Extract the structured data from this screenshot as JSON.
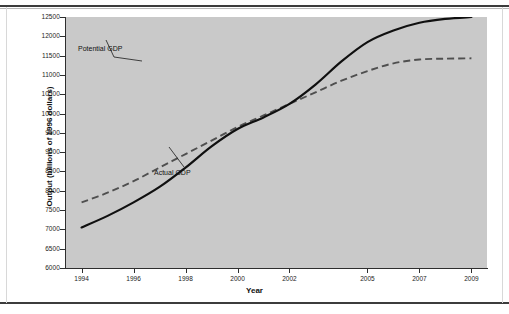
{
  "figure": {
    "background_color": "#ffffff",
    "plot_background_color": "#c9c9c9",
    "axis_color": "#2e2e2e"
  },
  "chart_data": {
    "type": "line",
    "title": "",
    "xlabel": "Year",
    "ylabel": "Output (billions of 1996 dollars)",
    "xlim": [
      1993.4,
      2009.6
    ],
    "ylim": [
      6000,
      12500
    ],
    "xticklabels": [
      "1994",
      "1996",
      "1998",
      "2000",
      "2002",
      "2005",
      "2007",
      "2009"
    ],
    "xtickvalues": [
      1994,
      1996,
      1998,
      2000,
      2002,
      2005,
      2007,
      2009
    ],
    "yticklabels": [
      "12500",
      "12000",
      "11500",
      "11000",
      "10500",
      "10000",
      "9500",
      "9000",
      "8500",
      "8000",
      "7500",
      "7000",
      "6500",
      "6000"
    ],
    "ytickvalues": [
      12500,
      12000,
      11500,
      11000,
      10500,
      10000,
      9500,
      9000,
      8500,
      8000,
      7500,
      7000,
      6500,
      6000
    ],
    "grid": false,
    "legend_position": "inline-annotations",
    "annotations": [
      {
        "text": "Potential GDP",
        "series": "Potential GDP"
      },
      {
        "text": "Actual GDP",
        "series": "Actual GDP"
      }
    ],
    "x": [
      1994,
      1995,
      1996,
      1997,
      1998,
      1999,
      2000,
      2001,
      2002,
      2003,
      2004,
      2005,
      2006,
      2007,
      2008,
      2009
    ],
    "series": [
      {
        "name": "Actual GDP",
        "style": "solid",
        "color": "#101010",
        "values": [
          7050,
          7350,
          7700,
          8100,
          8600,
          9150,
          9600,
          9900,
          10250,
          10750,
          11350,
          11850,
          12150,
          12350,
          12450,
          12500
        ]
      },
      {
        "name": "Potential GDP",
        "style": "dashed",
        "color": "#4f4f4f",
        "values": [
          7700,
          7950,
          8250,
          8600,
          8950,
          9300,
          9650,
          9950,
          10250,
          10550,
          10850,
          11100,
          11300,
          11400,
          11420,
          11430
        ]
      }
    ]
  }
}
